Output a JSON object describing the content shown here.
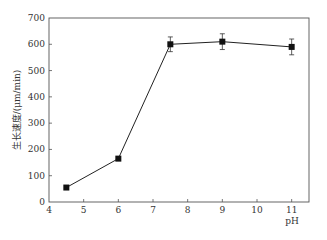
{
  "chart_data": {
    "type": "line",
    "title": "",
    "xlabel": "pH",
    "ylabel": "生长速度/(μm/min)",
    "xlim": [
      4,
      11.5
    ],
    "ylim": [
      0,
      700
    ],
    "x_ticks": [
      4,
      5,
      6,
      7,
      8,
      9,
      10,
      11
    ],
    "y_ticks": [
      0,
      100,
      200,
      300,
      400,
      500,
      600,
      700
    ],
    "grid": false,
    "legend": null,
    "marker": "square",
    "series": [
      {
        "name": "生长速度",
        "x": [
          4.5,
          6,
          7.5,
          9,
          11
        ],
        "values": [
          55,
          165,
          600,
          610,
          590
        ],
        "error": [
          0,
          0,
          28,
          30,
          30
        ]
      }
    ]
  }
}
